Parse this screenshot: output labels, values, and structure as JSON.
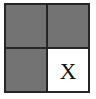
{
  "figure": {
    "kind": "2x2-grid-diagram",
    "rows": 2,
    "columns": 2,
    "background_color": "#ffffff",
    "frame_color": "#262626",
    "gridline_color": "#262626",
    "filled_color": "#737373",
    "empty_color": "#ffffff",
    "mark_color": "#151515"
  },
  "cells": [
    {
      "position": "top-left",
      "row": 1,
      "column": 1,
      "state": "filled",
      "fill": "#737373",
      "label": ""
    },
    {
      "position": "top-right",
      "row": 1,
      "column": 2,
      "state": "filled",
      "fill": "#737373",
      "label": ""
    },
    {
      "position": "bottom-left",
      "row": 2,
      "column": 1,
      "state": "filled",
      "fill": "#737373",
      "label": ""
    },
    {
      "position": "bottom-right",
      "row": 2,
      "column": 2,
      "state": "empty",
      "fill": "#ffffff",
      "label": "X"
    }
  ]
}
